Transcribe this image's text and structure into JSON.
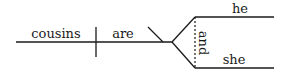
{
  "diagram": {
    "type": "sentence-diagram",
    "subject": "cousins",
    "verb": "are",
    "complement_type": "predicate-nominative",
    "conjunction": "and",
    "compound_complement": [
      "he",
      "she"
    ]
  }
}
